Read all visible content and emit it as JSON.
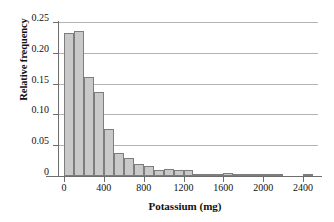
{
  "chart_data": {
    "type": "bar",
    "title": "",
    "subtitle": "",
    "xlabel": "Potassium (mg)",
    "ylabel": "Relative frequency",
    "xlim": [
      -50,
      2550
    ],
    "ylim": [
      0,
      0.25
    ],
    "grid": "horizontal",
    "legend": "none",
    "bin_width": 100,
    "x_tick_labels": [
      "0",
      "400",
      "800",
      "1200",
      "1600",
      "2000",
      "2400"
    ],
    "x_tick_values": [
      0,
      400,
      800,
      1200,
      1600,
      2000,
      2400
    ],
    "y_tick_labels": [
      "0",
      "0.05",
      "0.10",
      "0.15",
      "0.20",
      "0.25"
    ],
    "y_tick_values": [
      0,
      0.05,
      0.1,
      0.15,
      0.2,
      0.25
    ],
    "bin_starts": [
      0,
      100,
      200,
      300,
      400,
      500,
      600,
      700,
      800,
      900,
      1000,
      1100,
      1200,
      1300,
      1400,
      1500,
      1600,
      1700,
      1800,
      1900,
      2000,
      2100,
      2200,
      2300,
      2400
    ],
    "categories": [
      "0-100",
      "100-200",
      "200-300",
      "300-400",
      "400-500",
      "500-600",
      "600-700",
      "700-800",
      "800-900",
      "900-1000",
      "1000-1100",
      "1100-1200",
      "1200-1300",
      "1300-1400",
      "1400-1500",
      "1500-1600",
      "1600-1700",
      "1700-1800",
      "1800-1900",
      "1900-2000",
      "2000-2100",
      "2100-2200",
      "2200-2300",
      "2300-2400",
      "2400-2500"
    ],
    "values": [
      0.232,
      0.236,
      0.16,
      0.136,
      0.077,
      0.038,
      0.03,
      0.02,
      0.017,
      0.01,
      0.011,
      0.009,
      0.009,
      0.003,
      0.003,
      0.003,
      0.005,
      0.002,
      0.002,
      0.001,
      0.001,
      0.003,
      0.0,
      0.0,
      0.003
    ],
    "colors": {
      "bar_fill": "#c9c9c9",
      "bar_stroke": "#7d7d7d",
      "gridline": "#b4b4b4",
      "axis": "#6e6e6e",
      "text": "#111111",
      "background": "#ffffff"
    }
  }
}
